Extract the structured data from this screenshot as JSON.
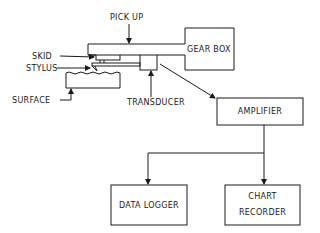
{
  "diagram": {
    "type": "block-diagram",
    "labels": {
      "pickup": "PICK UP",
      "skid": "SKID",
      "stylus": "STYLUS",
      "surface": "SURFACE",
      "transducer": "TRANSDUCER",
      "gearbox": "GEAR BOX",
      "amplifier": "AMPLIFIER",
      "data_logger": "DATA LOGGER",
      "chart_recorder_line1": "CHART",
      "chart_recorder_line2": "RECORDER"
    },
    "connections": [
      {
        "from": "transducer",
        "to": "amplifier"
      },
      {
        "from": "amplifier",
        "to": "data_logger"
      },
      {
        "from": "amplifier",
        "to": "chart_recorder"
      }
    ],
    "colors": {
      "stroke": "#1a1a1a",
      "background": "#ffffff"
    }
  }
}
